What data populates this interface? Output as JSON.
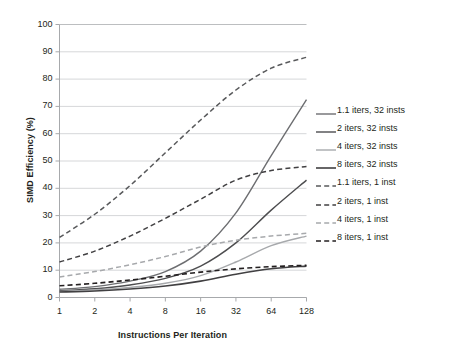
{
  "chart_data": {
    "type": "line",
    "title": "",
    "xlabel": "Instructions Per Iteration",
    "ylabel": "SIMD Efficiency (%)",
    "x": [
      1,
      2,
      4,
      8,
      16,
      32,
      64,
      128
    ],
    "x_tick_labels": [
      "1",
      "2",
      "4",
      "8",
      "16",
      "32",
      "64",
      "128"
    ],
    "x_scale": "log2",
    "y_tick_labels": [
      "0",
      "10",
      "20",
      "30",
      "40",
      "50",
      "60",
      "70",
      "80",
      "90",
      "100"
    ],
    "ylim": [
      0,
      100
    ],
    "grid": "horizontal",
    "legend_position": "right",
    "series": [
      {
        "name": "1.1 iters, 32 insts",
        "style": "solid",
        "color": "#6d6e71",
        "width": 1.4,
        "values": [
          3.0,
          4.0,
          6.0,
          9.5,
          17.0,
          31.0,
          52.0,
          72.5
        ]
      },
      {
        "name": "2 iters, 32 insts",
        "style": "solid",
        "color": "#4d4d4f",
        "width": 1.4,
        "values": [
          2.5,
          3.2,
          4.6,
          7.0,
          11.5,
          20.0,
          32.0,
          43.0
        ]
      },
      {
        "name": "4 iters, 32 insts",
        "style": "solid",
        "color": "#a7a9ac",
        "width": 1.4,
        "values": [
          2.2,
          2.8,
          3.7,
          5.2,
          8.0,
          13.0,
          19.0,
          22.5
        ]
      },
      {
        "name": "8 iters, 32 insts",
        "style": "solid",
        "color": "#414042",
        "width": 1.6,
        "values": [
          2.0,
          2.4,
          3.1,
          4.2,
          6.0,
          8.5,
          10.5,
          11.5
        ]
      },
      {
        "name": "1.1 iters, 1 inst",
        "style": "dashed",
        "color": "#58595b",
        "width": 1.5,
        "values": [
          22.0,
          30.5,
          41.0,
          53.0,
          65.0,
          76.0,
          84.0,
          88.0
        ]
      },
      {
        "name": "2 iters, 1 inst",
        "style": "dashed",
        "color": "#414042",
        "width": 1.5,
        "values": [
          13.0,
          17.0,
          22.5,
          29.0,
          36.0,
          43.0,
          46.5,
          48.0
        ]
      },
      {
        "name": "4 iters, 1 inst",
        "style": "dashed",
        "color": "#a7a9ac",
        "width": 1.5,
        "values": [
          7.5,
          9.5,
          12.0,
          15.0,
          18.5,
          21.0,
          22.5,
          23.5
        ]
      },
      {
        "name": "8 iters, 1 inst",
        "style": "dashed",
        "color": "#231f20",
        "width": 1.6,
        "values": [
          4.3,
          5.2,
          6.4,
          7.8,
          9.3,
          10.5,
          11.3,
          11.8
        ]
      }
    ]
  },
  "legend": {
    "items": [
      {
        "label": "1.1 iters, 32 insts"
      },
      {
        "label": "2 iters, 32 insts"
      },
      {
        "label": "4 iters, 32 insts"
      },
      {
        "label": "8 iters, 32 insts"
      },
      {
        "label": "1.1 iters, 1 inst"
      },
      {
        "label": "2 iters, 1 inst"
      },
      {
        "label": "4 iters, 1 inst"
      },
      {
        "label": "8 iters, 1 inst"
      }
    ]
  }
}
